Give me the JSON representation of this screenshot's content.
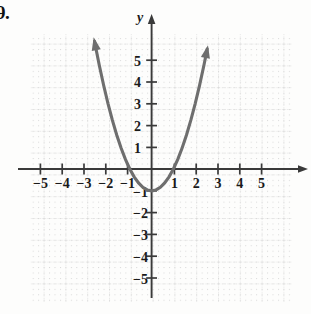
{
  "exercise": {
    "number": "9."
  },
  "chart_data": {
    "type": "line",
    "title": "",
    "xlabel": "",
    "ylabel": "y",
    "equation": "y = x^2 - 1",
    "curve_color": "#6e6e6e",
    "axis_color": "#3a3a3a",
    "grid_color": "#cfcfcf",
    "grid": true,
    "xlim": [
      -6,
      6
    ],
    "ylim": [
      -6,
      6
    ],
    "x_ticks": [
      -5,
      -4,
      -3,
      -2,
      -1,
      1,
      2,
      3,
      4,
      5
    ],
    "y_ticks": [
      5,
      4,
      3,
      2,
      1,
      -1,
      -2,
      -3,
      -4,
      -5
    ],
    "x_tick_labels": [
      "−5",
      "−4",
      "−3",
      "−2",
      "−1",
      "1",
      "2",
      "3",
      "4",
      "5"
    ],
    "y_tick_labels": [
      "5",
      "4",
      "3",
      "2",
      "1",
      "−1",
      "−2",
      "−3",
      "−4",
      "−5"
    ],
    "vertex": [
      0,
      -1
    ],
    "roots": [
      -1,
      1
    ],
    "arrowheads": [
      "left-branch-up",
      "right-branch-up",
      "x-axis-right",
      "y-axis-up"
    ],
    "x": [
      -2.62,
      -2.4,
      -2.2,
      -2.0,
      -1.8,
      -1.6,
      -1.4,
      -1.2,
      -1.0,
      -0.8,
      -0.6,
      -0.4,
      -0.2,
      0,
      0.2,
      0.4,
      0.6,
      0.8,
      1.0,
      1.2,
      1.4,
      1.6,
      1.8,
      2.0,
      2.2,
      2.4,
      2.55
    ],
    "y": [
      5.86,
      4.76,
      3.84,
      3.0,
      2.24,
      1.56,
      0.96,
      0.44,
      0.0,
      -0.36,
      -0.64,
      -0.84,
      -0.96,
      -1.0,
      -0.96,
      -0.84,
      -0.64,
      -0.36,
      0.0,
      0.44,
      0.96,
      1.56,
      2.24,
      3.0,
      3.84,
      4.76,
      5.5
    ]
  }
}
